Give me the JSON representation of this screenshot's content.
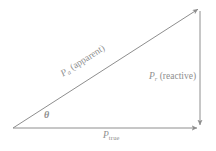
{
  "diagram": {
    "name": "power-triangle",
    "background_color": "#ffffff",
    "stroke_color": "#8e8e8e",
    "text_color": "#8e8e8e",
    "stroke_width": 1,
    "geometry": {
      "origin_x": 13,
      "origin_y": 128,
      "apex_x": 200,
      "apex_y": 8,
      "corner_x": 200,
      "corner_y": 128,
      "angle_degrees": 33
    },
    "labels": {
      "apparent": {
        "symbol": "P",
        "subscript": "a",
        "qualifier": "(apparent)",
        "full": "P a (apparent)"
      },
      "reactive": {
        "symbol": "P",
        "subscript": "r",
        "qualifier": "(reactive)",
        "full": "P r (reactive)"
      },
      "true_power": {
        "symbol": "P",
        "subscript": "true",
        "qualifier": "",
        "full": "P true"
      },
      "angle": {
        "symbol": "θ",
        "full": "θ"
      }
    }
  }
}
